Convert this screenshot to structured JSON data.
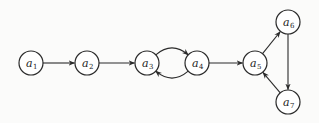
{
  "diagram": {
    "type": "directed-graph",
    "node_radius": 12,
    "colors": {
      "background": "#fbfbfa",
      "stroke": "#2a2a2a",
      "node_fill": "#ffffff",
      "text": "#222222"
    },
    "nodes": [
      {
        "id": "a1",
        "base": "a",
        "sub": "1",
        "x": 31,
        "y": 63
      },
      {
        "id": "a2",
        "base": "a",
        "sub": "2",
        "x": 87,
        "y": 63
      },
      {
        "id": "a3",
        "base": "a",
        "sub": "3",
        "x": 147,
        "y": 63
      },
      {
        "id": "a4",
        "base": "a",
        "sub": "4",
        "x": 197,
        "y": 63
      },
      {
        "id": "a5",
        "base": "a",
        "sub": "5",
        "x": 255,
        "y": 63
      },
      {
        "id": "a6",
        "base": "a",
        "sub": "6",
        "x": 288,
        "y": 22
      },
      {
        "id": "a7",
        "base": "a",
        "sub": "7",
        "x": 288,
        "y": 102
      }
    ],
    "edges": [
      {
        "from": "a1",
        "to": "a2",
        "style": "straight"
      },
      {
        "from": "a2",
        "to": "a3",
        "style": "straight"
      },
      {
        "from": "a3",
        "to": "a4",
        "style": "curve-up"
      },
      {
        "from": "a4",
        "to": "a3",
        "style": "curve-down"
      },
      {
        "from": "a4",
        "to": "a5",
        "style": "straight"
      },
      {
        "from": "a5",
        "to": "a6",
        "style": "straight"
      },
      {
        "from": "a6",
        "to": "a7",
        "style": "straight"
      },
      {
        "from": "a7",
        "to": "a5",
        "style": "straight"
      }
    ]
  }
}
